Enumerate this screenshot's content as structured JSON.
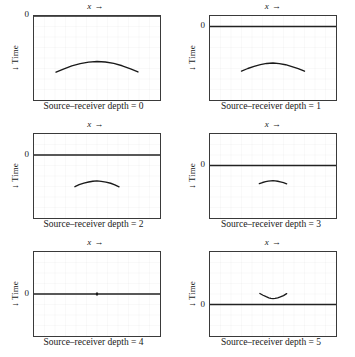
{
  "figure": {
    "type": "multi-panel-plot",
    "panel_count": 6,
    "columns": 2,
    "rows": 3,
    "axis_color": "#3a3a3a",
    "grid_color": "#6e6e6e",
    "curve_color": "#1a1a1a",
    "zero_line_color": "#222222"
  },
  "labels": {
    "x_axis": "x",
    "x_arrow": "→",
    "y_axis": "Time",
    "y_arrow": "↓",
    "zero": "0"
  },
  "chart_data": {
    "type": "line",
    "title": "",
    "xlabel": "x →",
    "ylabel": "← Time",
    "grid": true,
    "legend": "none",
    "shared_axes": {
      "grid_columns": 12,
      "grid_rows": 8,
      "xlim": [
        0,
        12
      ],
      "ylim": [
        0,
        8
      ],
      "x_tick_labels": [],
      "y_tick_labels": [
        "0"
      ]
    },
    "panels": [
      {
        "index": 0,
        "caption": "Source–receiver depth = 0",
        "zero_row": 0,
        "curve_orientation": "downward-opening",
        "x": [
          2.1,
          2.8,
          3.6,
          4.4,
          5.2,
          6.0,
          6.8,
          7.6,
          8.4,
          9.2,
          9.9
        ],
        "y": [
          5.35,
          5.05,
          4.75,
          4.53,
          4.39,
          4.33,
          4.38,
          4.52,
          4.74,
          5.03,
          5.33
        ]
      },
      {
        "index": 1,
        "caption": "Source–receiver depth = 1",
        "zero_row": 1,
        "curve_orientation": "downward-opening",
        "x": [
          3.0,
          3.6,
          4.2,
          4.8,
          5.4,
          6.0,
          6.6,
          7.2,
          7.8,
          8.4,
          9.0
        ],
        "y": [
          5.25,
          5.0,
          4.8,
          4.63,
          4.52,
          4.48,
          4.53,
          4.64,
          4.82,
          5.02,
          5.26
        ]
      },
      {
        "index": 2,
        "caption": "Source–receiver depth = 2",
        "zero_row": 2,
        "curve_orientation": "downward-opening",
        "x": [
          3.9,
          4.3,
          4.75,
          5.2,
          5.6,
          6.0,
          6.4,
          6.85,
          7.3,
          7.7,
          8.1
        ],
        "y": [
          5.02,
          4.83,
          4.68,
          4.57,
          4.5,
          4.47,
          4.51,
          4.58,
          4.69,
          4.84,
          5.03
        ]
      },
      {
        "index": 3,
        "caption": "Source–receiver depth = 3",
        "zero_row": 3,
        "curve_orientation": "downward-opening",
        "x": [
          4.7,
          5.0,
          5.3,
          5.55,
          5.8,
          6.0,
          6.2,
          6.45,
          6.7,
          7.0,
          7.3
        ],
        "y": [
          4.73,
          4.62,
          4.54,
          4.49,
          4.46,
          4.45,
          4.46,
          4.5,
          4.56,
          4.64,
          4.75
        ]
      },
      {
        "index": 4,
        "caption": "Source–receiver depth = 4",
        "zero_row": 4,
        "curve_orientation": "point",
        "x": [
          6.0
        ],
        "y": [
          4.0
        ]
      },
      {
        "index": 5,
        "caption": "Source–receiver depth = 5",
        "zero_row": 5,
        "curve_orientation": "upward-opening",
        "x": [
          4.75,
          5.05,
          5.35,
          5.6,
          5.8,
          6.0,
          6.2,
          6.45,
          6.7,
          7.0,
          7.3
        ],
        "y": [
          3.95,
          4.12,
          4.26,
          4.36,
          4.42,
          4.44,
          4.42,
          4.37,
          4.28,
          4.15,
          3.97
        ]
      }
    ]
  }
}
